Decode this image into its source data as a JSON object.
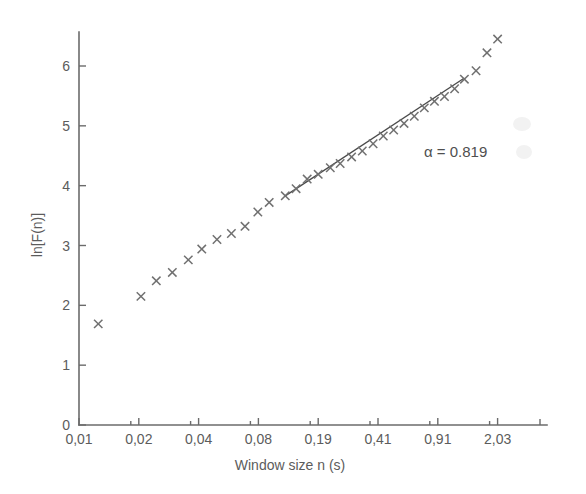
{
  "chart_data": {
    "type": "scatter",
    "title": "",
    "xlabel": "Window size n (s)",
    "ylabel": "ln[F(n)]",
    "grid": false,
    "legend": "none",
    "marker": "x",
    "x_tick_labels": [
      "0,01",
      "0,02",
      "0,04",
      "0,08",
      "0,19",
      "0,41",
      "0,91",
      "2,03"
    ],
    "x_tick_values": [
      0.01,
      0.02,
      0.04,
      0.08,
      0.19,
      0.41,
      0.91,
      2.03
    ],
    "x_scale": "log-spaced ticks at uniform pixel intervals",
    "y_tick_labels": [
      "0",
      "1",
      "2",
      "3",
      "4",
      "5",
      "6"
    ],
    "y_tick_values": [
      0,
      1,
      2,
      3,
      4,
      5,
      6
    ],
    "ylim": [
      0,
      6.6
    ],
    "xlabel_note": "window size n in seconds",
    "series": [
      {
        "name": "ln[F(n)] vs window size",
        "marker": "x",
        "points": [
          {
            "x": 0.0125,
            "y": 1.69
          },
          {
            "x": 0.0205,
            "y": 2.15
          },
          {
            "x": 0.0245,
            "y": 2.41
          },
          {
            "x": 0.0295,
            "y": 2.55
          },
          {
            "x": 0.0355,
            "y": 2.76
          },
          {
            "x": 0.0415,
            "y": 2.94
          },
          {
            "x": 0.0495,
            "y": 3.1
          },
          {
            "x": 0.0585,
            "y": 3.2
          },
          {
            "x": 0.0685,
            "y": 3.32
          },
          {
            "x": 0.0795,
            "y": 3.56
          },
          {
            "x": 0.0935,
            "y": 3.72
          },
          {
            "x": 0.118,
            "y": 3.83
          },
          {
            "x": 0.138,
            "y": 3.95
          },
          {
            "x": 0.162,
            "y": 4.11
          },
          {
            "x": 0.19,
            "y": 4.19
          },
          {
            "x": 0.222,
            "y": 4.3
          },
          {
            "x": 0.252,
            "y": 4.37
          },
          {
            "x": 0.292,
            "y": 4.48
          },
          {
            "x": 0.335,
            "y": 4.58
          },
          {
            "x": 0.385,
            "y": 4.7
          },
          {
            "x": 0.44,
            "y": 4.83
          },
          {
            "x": 0.505,
            "y": 4.93
          },
          {
            "x": 0.58,
            "y": 5.04
          },
          {
            "x": 0.665,
            "y": 5.16
          },
          {
            "x": 0.76,
            "y": 5.3
          },
          {
            "x": 0.87,
            "y": 5.41
          },
          {
            "x": 0.995,
            "y": 5.49
          },
          {
            "x": 1.14,
            "y": 5.62
          },
          {
            "x": 1.3,
            "y": 5.78
          },
          {
            "x": 1.52,
            "y": 5.92
          },
          {
            "x": 1.76,
            "y": 6.22
          },
          {
            "x": 2.03,
            "y": 6.45
          }
        ]
      }
    ],
    "fit": {
      "name": "linear scaling fit",
      "alpha": 0.819,
      "x_start": 0.118,
      "x_end": 1.3,
      "y_start": 3.83,
      "y_end": 5.8
    },
    "annotations": [
      {
        "name": "alpha-annotation",
        "text": "α = 0.819",
        "x": 0.52,
        "y": 4.62
      }
    ]
  },
  "labels": {
    "alpha_annotation": "α = 0.819",
    "x_axis_title": "Window size n (s)",
    "y_axis_title": "ln[F(n)]"
  }
}
